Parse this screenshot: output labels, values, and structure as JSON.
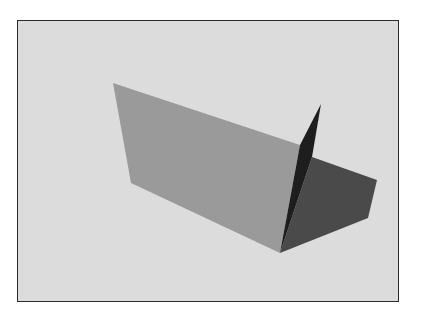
{
  "scene": {
    "description": "Grayscale 3D rendering of two perpendicular planes with cast shadow inside a bordered frame",
    "frame": {
      "x": 17,
      "y": 20,
      "width": 382,
      "height": 282,
      "border_color": "#2a2a2a",
      "background": "#dcdcdc"
    },
    "shapes": [
      {
        "name": "lit-plane",
        "fill": "#9a9a9a",
        "points": "113,83 300,145 280,253 131,183"
      },
      {
        "name": "shadow-region",
        "fill": "#4a4a4a",
        "points": "312,157 377,180 368,218 280,253"
      },
      {
        "name": "dark-vertical-plane",
        "fill": "#1e1e1e",
        "points": "300,145 321,104 312,157 280,253"
      }
    ]
  }
}
